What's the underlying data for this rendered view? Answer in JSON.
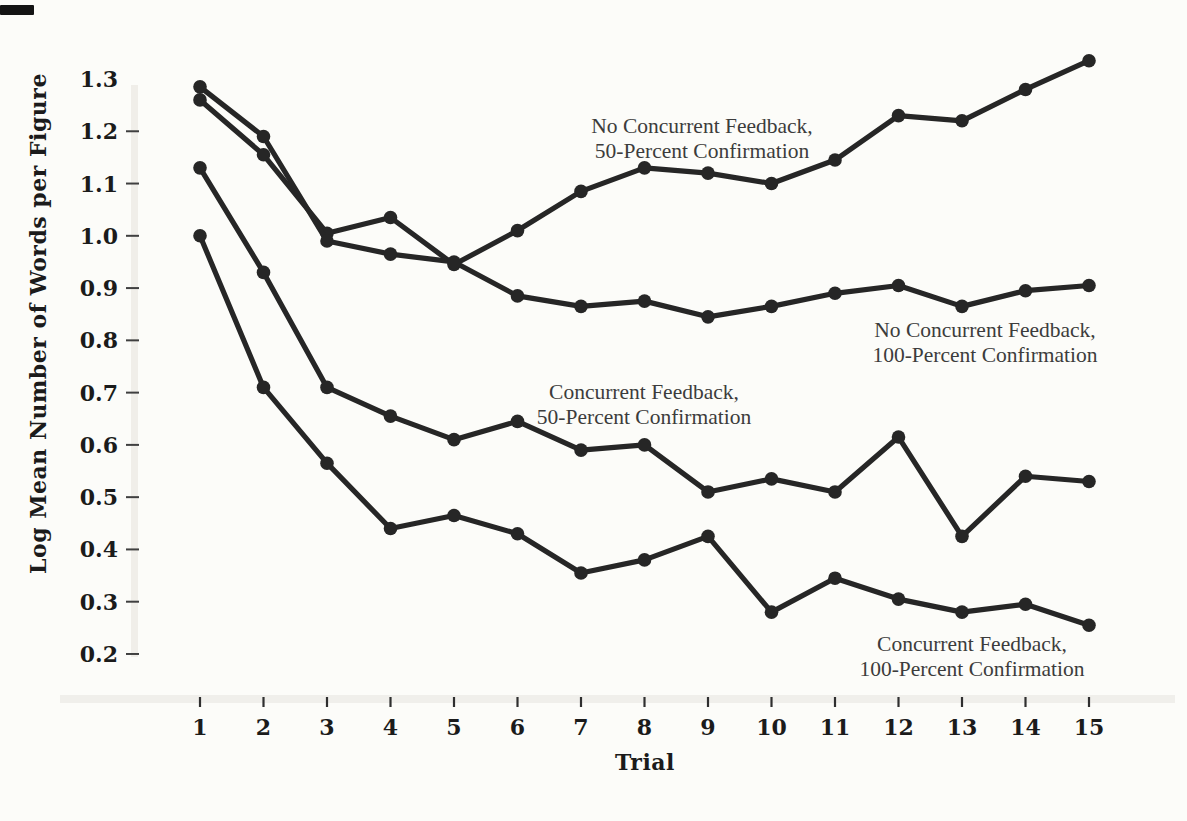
{
  "figure": {
    "kind": "scanned-book-line-graph",
    "background": "#fcfcf9",
    "ink_color": "#262626",
    "text_color": "#3c3c3c",
    "axis_text_color": "#1b1b1b"
  },
  "chart_data": {
    "type": "line",
    "title": "",
    "xlabel": "Trial",
    "ylabel": "Log Mean Number of Words per Figure",
    "x": [
      1,
      2,
      3,
      4,
      5,
      6,
      7,
      8,
      9,
      10,
      11,
      12,
      13,
      14,
      15
    ],
    "xlim": [
      1,
      15
    ],
    "ylim": [
      0.2,
      1.35
    ],
    "yticks": [
      1.3,
      1.2,
      1.1,
      1.0,
      0.9,
      0.8,
      0.7,
      0.6,
      0.5,
      0.4,
      0.3,
      0.2
    ],
    "grid": false,
    "legend_position": "inline-annotations",
    "marker": "filled-circle",
    "series": [
      {
        "name": "No Concurrent Feedback, 50-Percent Confirmation",
        "values": [
          1.26,
          1.155,
          1.005,
          1.035,
          0.945,
          1.01,
          1.085,
          1.13,
          1.12,
          1.1,
          1.145,
          1.23,
          1.22,
          1.28,
          1.335
        ],
        "label": {
          "lines": [
            "No Concurrent Feedback,",
            "50-Percent Confirmation"
          ],
          "x": 702,
          "y": 133
        }
      },
      {
        "name": "No Concurrent Feedback, 100-Percent Confirmation",
        "values": [
          1.285,
          1.19,
          0.99,
          0.965,
          0.95,
          0.885,
          0.865,
          0.875,
          0.845,
          0.865,
          0.89,
          0.905,
          0.865,
          0.895,
          0.905
        ],
        "label": {
          "lines": [
            "No Concurrent Feedback,",
            "100-Percent Confirmation"
          ],
          "x": 985,
          "y": 337
        }
      },
      {
        "name": "Concurrent Feedback, 50-Percent Confirmation",
        "values": [
          1.13,
          0.93,
          0.71,
          0.655,
          0.61,
          0.645,
          0.59,
          0.6,
          0.51,
          0.535,
          0.51,
          0.615,
          0.425,
          0.54,
          0.53
        ],
        "label": {
          "lines": [
            "Concurrent Feedback,",
            "50-Percent Confirmation"
          ],
          "x": 644,
          "y": 399
        }
      },
      {
        "name": "Concurrent Feedback, 100-Percent Confirmation",
        "values": [
          1.0,
          0.71,
          0.565,
          0.44,
          0.465,
          0.43,
          0.355,
          0.38,
          0.425,
          0.28,
          0.345,
          0.305,
          0.28,
          0.295,
          0.255
        ],
        "label": {
          "lines": [
            "Concurrent Feedback,",
            "100-Percent Confirmation"
          ],
          "x": 972,
          "y": 651
        }
      }
    ]
  }
}
